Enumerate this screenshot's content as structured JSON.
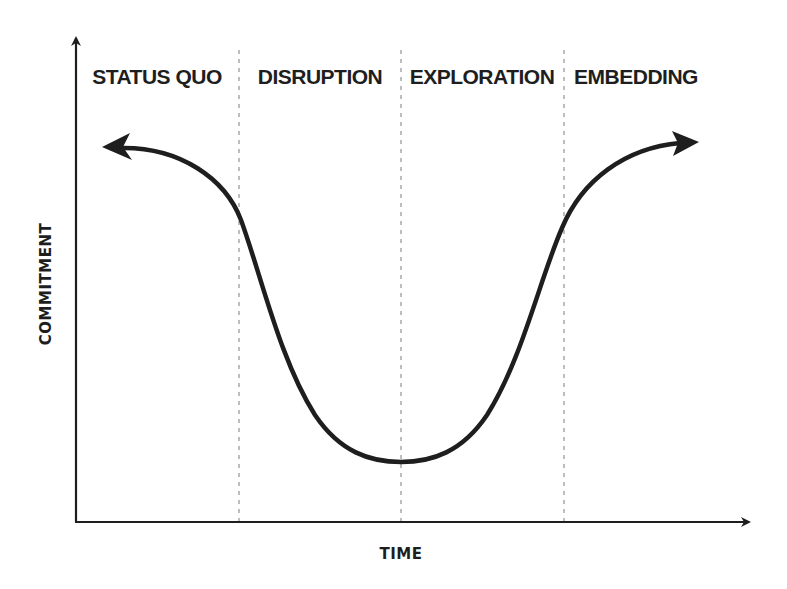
{
  "diagram": {
    "type": "change-curve",
    "x_axis_label": "TIME",
    "y_axis_label": "COMMITMENT",
    "phases": [
      {
        "label": "STATUS QUO"
      },
      {
        "label": "DISRUPTION"
      },
      {
        "label": "EXPLORATION"
      },
      {
        "label": "EMBEDDING"
      }
    ],
    "colors": {
      "ink": "#1e1e1e",
      "divider": "#a8a8a8",
      "background": "#ffffff"
    }
  }
}
